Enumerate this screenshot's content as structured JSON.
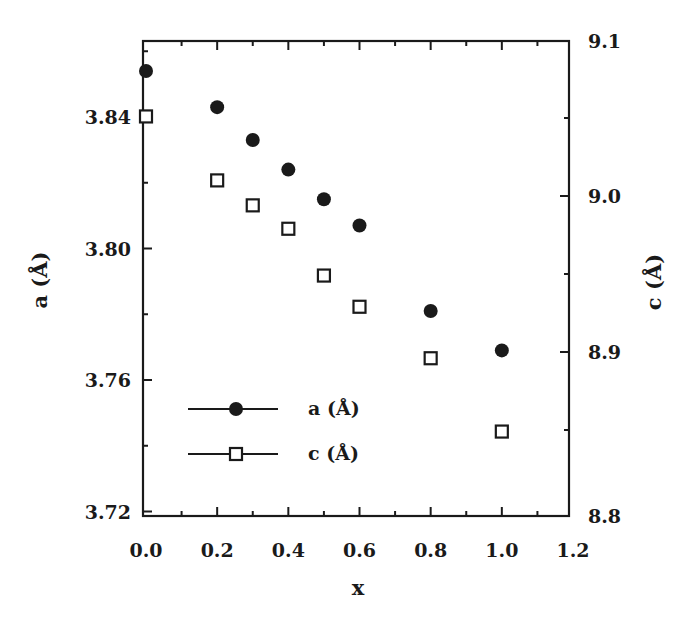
{
  "chart_data": {
    "type": "scatter",
    "title": "",
    "xlabel": "x",
    "ylabel": "a (Å)",
    "y2label": "c (Å)",
    "xlim": [
      0.0,
      1.2
    ],
    "ylim": [
      3.72,
      3.861
    ],
    "y2lim": [
      8.8,
      9.1
    ],
    "grid": false,
    "legend_position": "lower-left inside",
    "x_ticks": [
      "0.0",
      "0.2",
      "0.4",
      "0.6",
      "0.8",
      "1.0",
      "1.2"
    ],
    "y_ticks": [
      "3.72",
      "3.76",
      "3.80",
      "3.84"
    ],
    "y2_ticks": [
      "8.8",
      "8.9",
      "9.0",
      "9.1"
    ],
    "x": [
      0.0,
      0.2,
      0.3,
      0.4,
      0.5,
      0.6,
      0.8,
      1.0
    ],
    "series": [
      {
        "name": "a (Å)",
        "axis": "left",
        "marker": "filled-circle",
        "values": [
          3.854,
          3.843,
          3.833,
          3.824,
          3.815,
          3.807,
          3.781,
          3.769
        ]
      },
      {
        "name": "c (Å)",
        "axis": "right",
        "marker": "open-square",
        "values": [
          9.051,
          9.01,
          8.994,
          8.979,
          8.949,
          8.929,
          8.896,
          8.849
        ]
      }
    ],
    "colors": {
      "ink": "#1a1a1a",
      "background": "#ffffff"
    }
  }
}
